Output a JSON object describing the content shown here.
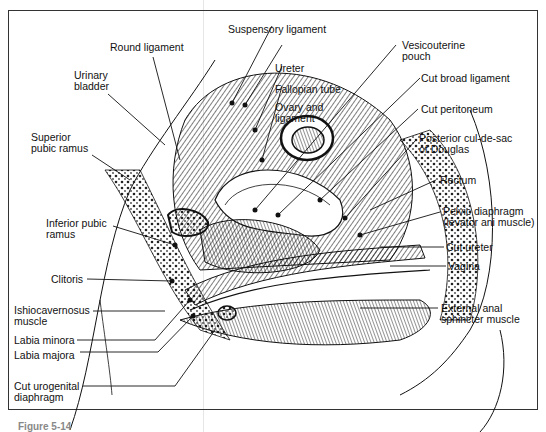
{
  "figure": {
    "caption": "Figure 5-14",
    "labels_left": [
      {
        "id": "round-ligament",
        "text": "Round ligament"
      },
      {
        "id": "urinary-bladder",
        "line1": "Urinary",
        "line2": "bladder"
      },
      {
        "id": "superior-pubic-ramus",
        "line1": "Superior",
        "line2": "pubic ramus"
      },
      {
        "id": "inferior-pubic-ramus",
        "line1": "Inferior pubic",
        "line2": "ramus"
      },
      {
        "id": "clitoris",
        "text": "Clitoris"
      },
      {
        "id": "ishiocavernosus",
        "line1": "Ishiocavernosus",
        "line2": "muscle"
      },
      {
        "id": "labia-minora",
        "text": "Labia minora"
      },
      {
        "id": "labia-majora",
        "text": "Labia majora"
      },
      {
        "id": "cut-urogenital-diaphragm",
        "line1": "Cut urogenital",
        "line2": "diaphragm"
      }
    ],
    "labels_top": [
      {
        "id": "suspensory-ligament",
        "text": "Suspensory ligament"
      },
      {
        "id": "ureter",
        "text": "Ureter"
      },
      {
        "id": "fallopian-tube",
        "text": "Fallopian tube"
      },
      {
        "id": "ovary-and-ligament",
        "line1": "Ovary and",
        "line2": "ligament"
      }
    ],
    "labels_right": [
      {
        "id": "vesicouterine-pouch",
        "line1": "Vesicouterine",
        "line2": "pouch"
      },
      {
        "id": "cut-broad-ligament",
        "text": "Cut broad ligament"
      },
      {
        "id": "cut-peritoneum",
        "text": "Cut peritoneum"
      },
      {
        "id": "posterior-cul-de-sac",
        "line1": "Posterior cul-de-sac",
        "line2": "of Douglas"
      },
      {
        "id": "rectum",
        "text": "Rectum"
      },
      {
        "id": "pelvic-diaphragm",
        "line1": "Pelvic diaphragm",
        "line2": "(levator ani muscle)"
      },
      {
        "id": "cut-ureter",
        "text": "Cut ureter"
      },
      {
        "id": "vagina",
        "text": "Vagina"
      },
      {
        "id": "external-anal-sphincter",
        "line1": "External anal",
        "line2": "sphincter muscle"
      }
    ]
  }
}
